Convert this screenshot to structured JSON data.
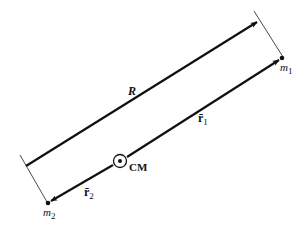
{
  "diagram": {
    "type": "two-body center-of-mass vector diagram",
    "colors": {
      "stroke": "#111111",
      "background": "#ffffff",
      "tick": "#333333"
    },
    "labels": {
      "R": "R",
      "r1_base": "r̄",
      "r1_sub": "1",
      "r2_base": "r̄",
      "r2_sub": "2",
      "m1_base": "m",
      "m1_sub": "1",
      "m2_base": "m",
      "m2_sub": "2",
      "cm": "CM"
    },
    "points": {
      "m1": {
        "x": 282,
        "y": 58
      },
      "m2": {
        "x": 48,
        "y": 203
      },
      "cm": {
        "x": 120,
        "y": 161
      }
    },
    "vectors": [
      {
        "name": "R",
        "from": [
          26,
          166
        ],
        "to": [
          257,
          22
        ]
      },
      {
        "name": "r1",
        "from": [
          127,
          157
        ],
        "to": [
          279,
          60
        ]
      },
      {
        "name": "r2",
        "from": [
          113,
          165
        ],
        "to": [
          51,
          201
        ]
      }
    ]
  }
}
